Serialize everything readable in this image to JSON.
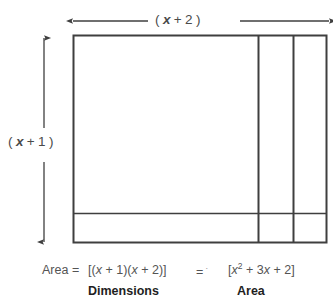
{
  "figure": {
    "background_color": "#ffffff",
    "stroke_color": "#3f3f3f",
    "text_color": "#4a4a4a"
  },
  "dimensions": {
    "width_label": {
      "open_paren": "(",
      "variable": "x",
      "operator": "+",
      "constant": "2",
      "close_paren": ")",
      "full_text": "( x + 2 )"
    },
    "height_label": {
      "open_paren": "(",
      "variable": "x",
      "operator": "+",
      "constant": "1",
      "close_paren": ")",
      "full_text": "( x + 1 )"
    }
  },
  "arrows": {
    "width_arrow": {
      "orientation": "horizontal",
      "style": "double-headed",
      "split_by_label": true
    },
    "height_arrow": {
      "orientation": "vertical",
      "style": "double-headed",
      "split_by_label": true
    }
  },
  "rectangle": {
    "vertical_divider_count": 2,
    "horizontal_divider_count": 1,
    "region_count": 6
  },
  "equation": {
    "area_word": "Area =",
    "dimensions_expression_prefix": "[(",
    "dimensions_expression": "[(x + 1)(x + 2)]",
    "equals": "=",
    "equals_mark": "·",
    "area_expression": "[x² + 3x + 2]",
    "area_expr_parts": {
      "open_bracket": "[",
      "x": "x",
      "exponent": "2",
      "plus_one": "+",
      "coefficient": "3",
      "x2": "x",
      "plus_two": "+",
      "constant": "2",
      "close_bracket": "]"
    }
  },
  "captions": {
    "dimensions": "Dimensions",
    "area": "Area"
  }
}
